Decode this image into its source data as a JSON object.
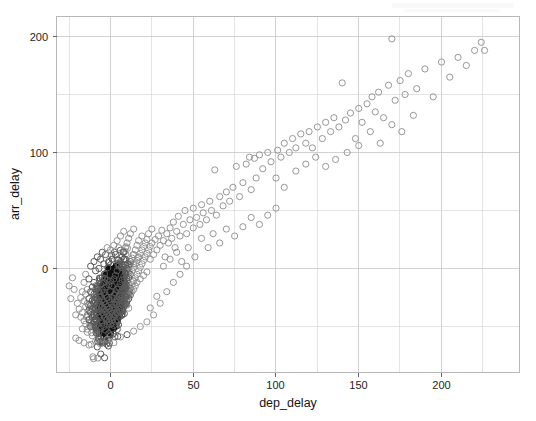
{
  "figure": {
    "background_color": "#ffffff",
    "point_color": "#8c8c8c",
    "dense_point_color": "#101010",
    "grid_color": "#c6c6c6",
    "panel_border_color": "#b0b0b0"
  },
  "axes": {
    "x_title": "dep_delay",
    "y_title": "arr_delay",
    "x_ticks": [
      "0",
      "50",
      "100",
      "150",
      "200"
    ],
    "y_ticks": [
      "0",
      "100",
      "200"
    ]
  },
  "chart_data": {
    "type": "scatter",
    "title": "",
    "subtitle": "",
    "xlabel": "dep_delay",
    "ylabel": "arr_delay",
    "xlim": [
      -33,
      238
    ],
    "ylim": [
      -72,
      222
    ],
    "x_ticks": [
      0,
      50,
      100,
      150,
      200
    ],
    "y_ticks": [
      0,
      100,
      200
    ],
    "x_minor_ticks": [
      -25,
      25,
      75,
      125,
      175,
      225
    ],
    "y_minor_ticks": [
      -50,
      50,
      150
    ],
    "grid": true,
    "legend": null,
    "marker": "open-circle",
    "marker_color": "#8c8c8c",
    "marker_size": 3.1,
    "points": [
      [
        -20,
        -30
      ],
      [
        -19,
        -35
      ],
      [
        -18,
        -25
      ],
      [
        -18,
        -42
      ],
      [
        -17,
        -20
      ],
      [
        -17,
        -38
      ],
      [
        -17,
        -52
      ],
      [
        -16,
        -28
      ],
      [
        -16,
        -45
      ],
      [
        -16,
        -12
      ],
      [
        -15,
        -33
      ],
      [
        -15,
        -48
      ],
      [
        -15,
        -22
      ],
      [
        -15,
        -5
      ],
      [
        -14,
        -40
      ],
      [
        -14,
        -30
      ],
      [
        -14,
        -18
      ],
      [
        -14,
        -55
      ],
      [
        -13,
        -36
      ],
      [
        -13,
        -26
      ],
      [
        -13,
        -44
      ],
      [
        -13,
        -9
      ],
      [
        -12,
        -32
      ],
      [
        -12,
        -50
      ],
      [
        -12,
        -20
      ],
      [
        -12,
        -38
      ],
      [
        -12,
        2
      ],
      [
        -11,
        -28
      ],
      [
        -11,
        -42
      ],
      [
        -11,
        -16
      ],
      [
        -11,
        -35
      ],
      [
        -11,
        -58
      ],
      [
        -10,
        -30
      ],
      [
        -10,
        -46
      ],
      [
        -10,
        -22
      ],
      [
        -10,
        -12
      ],
      [
        -10,
        -40
      ],
      [
        -10,
        6
      ],
      [
        -9,
        -34
      ],
      [
        -9,
        -25
      ],
      [
        -9,
        -50
      ],
      [
        -9,
        -18
      ],
      [
        -9,
        -44
      ],
      [
        -9,
        -2
      ],
      [
        -8,
        -30
      ],
      [
        -8,
        -38
      ],
      [
        -8,
        -15
      ],
      [
        -8,
        -48
      ],
      [
        -8,
        -26
      ],
      [
        -8,
        10
      ],
      [
        -7,
        -33
      ],
      [
        -7,
        -42
      ],
      [
        -7,
        -20
      ],
      [
        -7,
        -55
      ],
      [
        -7,
        -28
      ],
      [
        -7,
        0
      ],
      [
        -6,
        -36
      ],
      [
        -6,
        -24
      ],
      [
        -6,
        -45
      ],
      [
        -6,
        -14
      ],
      [
        -6,
        -52
      ],
      [
        -6,
        -31
      ],
      [
        -6,
        8
      ],
      [
        -5,
        -38
      ],
      [
        -5,
        -27
      ],
      [
        -5,
        -18
      ],
      [
        -5,
        -47
      ],
      [
        -5,
        -33
      ],
      [
        -5,
        -8
      ],
      [
        -5,
        14
      ],
      [
        -4,
        -40
      ],
      [
        -4,
        -29
      ],
      [
        -4,
        -21
      ],
      [
        -4,
        -50
      ],
      [
        -4,
        -35
      ],
      [
        -4,
        -12
      ],
      [
        -4,
        4
      ],
      [
        -3,
        -42
      ],
      [
        -3,
        -31
      ],
      [
        -3,
        -23
      ],
      [
        -3,
        -53
      ],
      [
        -3,
        -37
      ],
      [
        -3,
        -16
      ],
      [
        -3,
        12
      ],
      [
        -2,
        -44
      ],
      [
        -2,
        -33
      ],
      [
        -2,
        -25
      ],
      [
        -2,
        -48
      ],
      [
        -2,
        -39
      ],
      [
        -2,
        -10
      ],
      [
        -2,
        18
      ],
      [
        -1,
        -46
      ],
      [
        -1,
        -35
      ],
      [
        -1,
        -27
      ],
      [
        -1,
        -56
      ],
      [
        -1,
        -41
      ],
      [
        -1,
        -14
      ],
      [
        -1,
        6
      ],
      [
        0,
        -48
      ],
      [
        0,
        -37
      ],
      [
        0,
        -29
      ],
      [
        0,
        -20
      ],
      [
        0,
        -43
      ],
      [
        0,
        -11
      ],
      [
        0,
        16
      ],
      [
        0,
        -58
      ],
      [
        1,
        -45
      ],
      [
        1,
        -34
      ],
      [
        1,
        -26
      ],
      [
        1,
        -52
      ],
      [
        1,
        -39
      ],
      [
        1,
        -15
      ],
      [
        1,
        8
      ],
      [
        2,
        -42
      ],
      [
        2,
        -31
      ],
      [
        2,
        -23
      ],
      [
        2,
        -49
      ],
      [
        2,
        -36
      ],
      [
        2,
        -9
      ],
      [
        2,
        20
      ],
      [
        3,
        -40
      ],
      [
        3,
        -29
      ],
      [
        3,
        -21
      ],
      [
        3,
        -46
      ],
      [
        3,
        -34
      ],
      [
        3,
        -6
      ],
      [
        3,
        12
      ],
      [
        4,
        -38
      ],
      [
        4,
        -27
      ],
      [
        4,
        -18
      ],
      [
        4,
        -44
      ],
      [
        4,
        -31
      ],
      [
        4,
        -2
      ],
      [
        4,
        24
      ],
      [
        5,
        -35
      ],
      [
        5,
        -24
      ],
      [
        5,
        -16
      ],
      [
        5,
        -41
      ],
      [
        5,
        -28
      ],
      [
        5,
        2
      ],
      [
        5,
        18
      ],
      [
        6,
        -33
      ],
      [
        6,
        -22
      ],
      [
        6,
        -13
      ],
      [
        6,
        -38
      ],
      [
        6,
        -26
      ],
      [
        6,
        6
      ],
      [
        6,
        28
      ],
      [
        7,
        -30
      ],
      [
        7,
        -19
      ],
      [
        7,
        -10
      ],
      [
        7,
        -36
      ],
      [
        7,
        -23
      ],
      [
        7,
        10
      ],
      [
        8,
        -28
      ],
      [
        8,
        -17
      ],
      [
        8,
        -7
      ],
      [
        8,
        -33
      ],
      [
        8,
        -20
      ],
      [
        8,
        14
      ],
      [
        8,
        32
      ],
      [
        9,
        -25
      ],
      [
        9,
        -14
      ],
      [
        9,
        -4
      ],
      [
        9,
        -31
      ],
      [
        9,
        -18
      ],
      [
        9,
        18
      ],
      [
        10,
        -22
      ],
      [
        10,
        -11
      ],
      [
        10,
        0
      ],
      [
        10,
        -28
      ],
      [
        10,
        -15
      ],
      [
        10,
        22
      ],
      [
        11,
        -20
      ],
      [
        11,
        -8
      ],
      [
        11,
        3
      ],
      [
        11,
        -26
      ],
      [
        11,
        26
      ],
      [
        12,
        -17
      ],
      [
        12,
        -5
      ],
      [
        12,
        6
      ],
      [
        12,
        -23
      ],
      [
        12,
        30
      ],
      [
        13,
        -14
      ],
      [
        13,
        -2
      ],
      [
        13,
        9
      ],
      [
        13,
        -20
      ],
      [
        14,
        -11
      ],
      [
        14,
        1
      ],
      [
        14,
        12
      ],
      [
        14,
        -18
      ],
      [
        14,
        34
      ],
      [
        15,
        -8
      ],
      [
        15,
        4
      ],
      [
        15,
        16
      ],
      [
        15,
        -15
      ],
      [
        16,
        -5
      ],
      [
        16,
        7
      ],
      [
        16,
        20
      ],
      [
        16,
        -12
      ],
      [
        17,
        -2
      ],
      [
        17,
        10
      ],
      [
        17,
        24
      ],
      [
        18,
        1
      ],
      [
        18,
        13
      ],
      [
        18,
        -9
      ],
      [
        19,
        4
      ],
      [
        19,
        16
      ],
      [
        19,
        28
      ],
      [
        20,
        7
      ],
      [
        20,
        19
      ],
      [
        20,
        -6
      ],
      [
        21,
        10
      ],
      [
        21,
        22
      ],
      [
        22,
        13
      ],
      [
        22,
        25
      ],
      [
        22,
        -3
      ],
      [
        23,
        16
      ],
      [
        23,
        30
      ],
      [
        24,
        19
      ],
      [
        24,
        8
      ],
      [
        25,
        22
      ],
      [
        25,
        34
      ],
      [
        26,
        12
      ],
      [
        27,
        25
      ],
      [
        28,
        16
      ],
      [
        29,
        28
      ],
      [
        30,
        20
      ],
      [
        31,
        33
      ],
      [
        32,
        24
      ],
      [
        33,
        10
      ],
      [
        34,
        30
      ],
      [
        35,
        22
      ],
      [
        36,
        35
      ],
      [
        37,
        26
      ],
      [
        38,
        40
      ],
      [
        39,
        18
      ],
      [
        40,
        32
      ],
      [
        41,
        45
      ],
      [
        42,
        28
      ],
      [
        44,
        38
      ],
      [
        45,
        50
      ],
      [
        46,
        30
      ],
      [
        48,
        42
      ],
      [
        50,
        35
      ],
      [
        50,
        52
      ],
      [
        52,
        44
      ],
      [
        54,
        38
      ],
      [
        55,
        55
      ],
      [
        56,
        48
      ],
      [
        58,
        42
      ],
      [
        60,
        58
      ],
      [
        61,
        50
      ],
      [
        63,
        85
      ],
      [
        64,
        46
      ],
      [
        66,
        62
      ],
      [
        68,
        54
      ],
      [
        70,
        66
      ],
      [
        72,
        58
      ],
      [
        74,
        70
      ],
      [
        76,
        88
      ],
      [
        78,
        62
      ],
      [
        80,
        74
      ],
      [
        82,
        90
      ],
      [
        84,
        96
      ],
      [
        85,
        68
      ],
      [
        87,
        95
      ],
      [
        88,
        78
      ],
      [
        90,
        98
      ],
      [
        92,
        86
      ],
      [
        95,
        100
      ],
      [
        97,
        92
      ],
      [
        100,
        52
      ],
      [
        101,
        102
      ],
      [
        103,
        96
      ],
      [
        105,
        108
      ],
      [
        108,
        100
      ],
      [
        110,
        112
      ],
      [
        112,
        104
      ],
      [
        115,
        116
      ],
      [
        118,
        108
      ],
      [
        120,
        118
      ],
      [
        122,
        104
      ],
      [
        125,
        122
      ],
      [
        128,
        112
      ],
      [
        130,
        126
      ],
      [
        133,
        118
      ],
      [
        135,
        130
      ],
      [
        138,
        122
      ],
      [
        140,
        160
      ],
      [
        142,
        128
      ],
      [
        145,
        134
      ],
      [
        148,
        112
      ],
      [
        150,
        138
      ],
      [
        152,
        126
      ],
      [
        155,
        142
      ],
      [
        158,
        148
      ],
      [
        160,
        135
      ],
      [
        162,
        152
      ],
      [
        165,
        130
      ],
      [
        168,
        158
      ],
      [
        170,
        198
      ],
      [
        172,
        145
      ],
      [
        175,
        162
      ],
      [
        178,
        150
      ],
      [
        180,
        168
      ],
      [
        185,
        155
      ],
      [
        190,
        172
      ],
      [
        195,
        148
      ],
      [
        200,
        178
      ],
      [
        205,
        165
      ],
      [
        210,
        182
      ],
      [
        215,
        175
      ],
      [
        220,
        188
      ],
      [
        224,
        195
      ],
      [
        226,
        188
      ],
      [
        -22,
        -18
      ],
      [
        -21,
        -40
      ],
      [
        -23,
        -8
      ],
      [
        -24,
        -26
      ],
      [
        -25,
        -15
      ],
      [
        -21,
        -60
      ],
      [
        -19,
        -62
      ],
      [
        -16,
        -64
      ],
      [
        -13,
        -66
      ],
      [
        -9,
        -63
      ],
      [
        -6,
        -65
      ],
      [
        -2,
        -61
      ],
      [
        2,
        -64
      ],
      [
        6,
        -59
      ],
      [
        10,
        -57
      ],
      [
        14,
        -54
      ],
      [
        18,
        -50
      ],
      [
        22,
        -46
      ],
      [
        26,
        -40
      ],
      [
        30,
        -30
      ],
      [
        34,
        -20
      ],
      [
        38,
        -12
      ],
      [
        42,
        -5
      ],
      [
        46,
        2
      ],
      [
        24,
        -34
      ],
      [
        28,
        -24
      ],
      [
        32,
        2
      ],
      [
        36,
        8
      ],
      [
        40,
        14
      ],
      [
        43,
        6
      ],
      [
        47,
        18
      ],
      [
        51,
        10
      ],
      [
        55,
        26
      ],
      [
        59,
        18
      ],
      [
        62,
        30
      ],
      [
        66,
        22
      ],
      [
        70,
        34
      ],
      [
        75,
        28
      ],
      [
        80,
        36
      ],
      [
        85,
        44
      ],
      [
        90,
        38
      ],
      [
        95,
        46
      ],
      [
        100,
        78
      ],
      [
        105,
        70
      ],
      [
        112,
        84
      ],
      [
        118,
        90
      ],
      [
        124,
        96
      ],
      [
        130,
        88
      ],
      [
        136,
        94
      ],
      [
        143,
        100
      ],
      [
        150,
        106
      ],
      [
        157,
        118
      ],
      [
        163,
        108
      ],
      [
        170,
        124
      ],
      [
        176,
        118
      ],
      [
        183,
        132
      ]
    ]
  },
  "dense_cluster": {
    "description": "Overplotted black core",
    "x_range": [
      -13,
      12
    ],
    "y_range": [
      -56,
      14
    ],
    "peak_x": 0,
    "peak_y": -28,
    "approx_count": 900
  }
}
